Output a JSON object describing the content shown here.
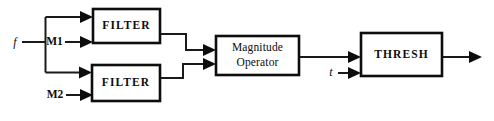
{
  "diagram": {
    "blocks": [
      {
        "id": "filter_top",
        "label": "FILTER"
      },
      {
        "id": "filter_bottom",
        "label": "FILTER"
      },
      {
        "id": "magnitude",
        "label_line1": "Magnitude",
        "label_line2": "Operator"
      },
      {
        "id": "thresh",
        "label": "THRESH"
      }
    ],
    "labels": {
      "input_f": "f",
      "mask_1": "M1",
      "mask_2": "M2",
      "threshold_t": "t"
    },
    "colors": {
      "background": "#ffffff",
      "stroke": "#0d0d0d",
      "wire": "#1a1a1a"
    }
  }
}
